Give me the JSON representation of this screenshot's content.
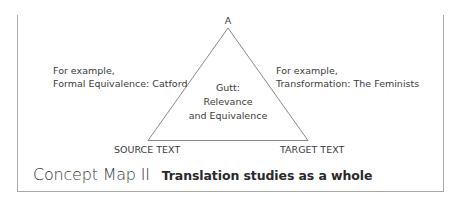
{
  "diagram": {
    "apex_label": "A",
    "left_note": {
      "line1": "For example,",
      "line2": "Formal Equivalence: Catford"
    },
    "right_note": {
      "line1": "For example,",
      "line2": "Transformation: The Feminists"
    },
    "center_note": {
      "line1": "Gutt:",
      "line2": "Relevance",
      "line3": "and Equivalence"
    },
    "bottom_left_label": "SOURCE TEXT",
    "bottom_right_label": "TARGET TEXT",
    "colors": {
      "text": "#3a3a3a",
      "triangle_stroke": "#8a8a8a",
      "frame_border": "#a9a9a9"
    }
  },
  "caption": {
    "title": "Concept Map II",
    "subtitle": "Translation studies as a whole"
  }
}
